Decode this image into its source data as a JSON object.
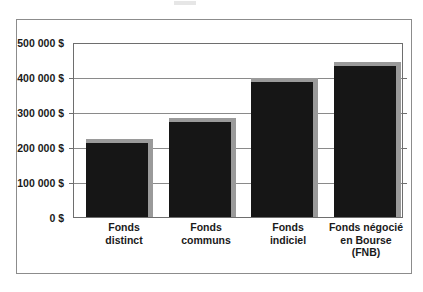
{
  "chart_data": {
    "type": "bar",
    "title": "",
    "subtitle": "",
    "xlabel": "",
    "ylabel": "",
    "categories": [
      "Fonds\ndistinct",
      "Fonds\ncommuns",
      "Fonds\nindiciel",
      "Fonds négocié\nen Bourse\n(FNB)"
    ],
    "values": [
      210000,
      270000,
      385000,
      430000
    ],
    "ylim": [
      0,
      500000
    ],
    "ytick_values": [
      0,
      100000,
      200000,
      300000,
      400000,
      500000
    ],
    "ytick_labels": [
      "0 $",
      "100 000 $",
      "200 000 $",
      "300 000 $",
      "400 000 $",
      "500 000 $"
    ],
    "grid": true,
    "legend": "none",
    "currency_symbol": "$",
    "locale_thousands_separator": " ",
    "series": [
      {
        "name": "Valeur",
        "values": [
          210000,
          270000,
          385000,
          430000
        ]
      }
    ],
    "colors": {
      "bar_fill": "#161616",
      "bar_shadow": "#9a9a9a",
      "gridline": "#8a8a8a",
      "axis": "#6e6e6e",
      "frame": "#8c8c8c",
      "background": "#ffffff",
      "text": "#1a1a1a"
    }
  }
}
